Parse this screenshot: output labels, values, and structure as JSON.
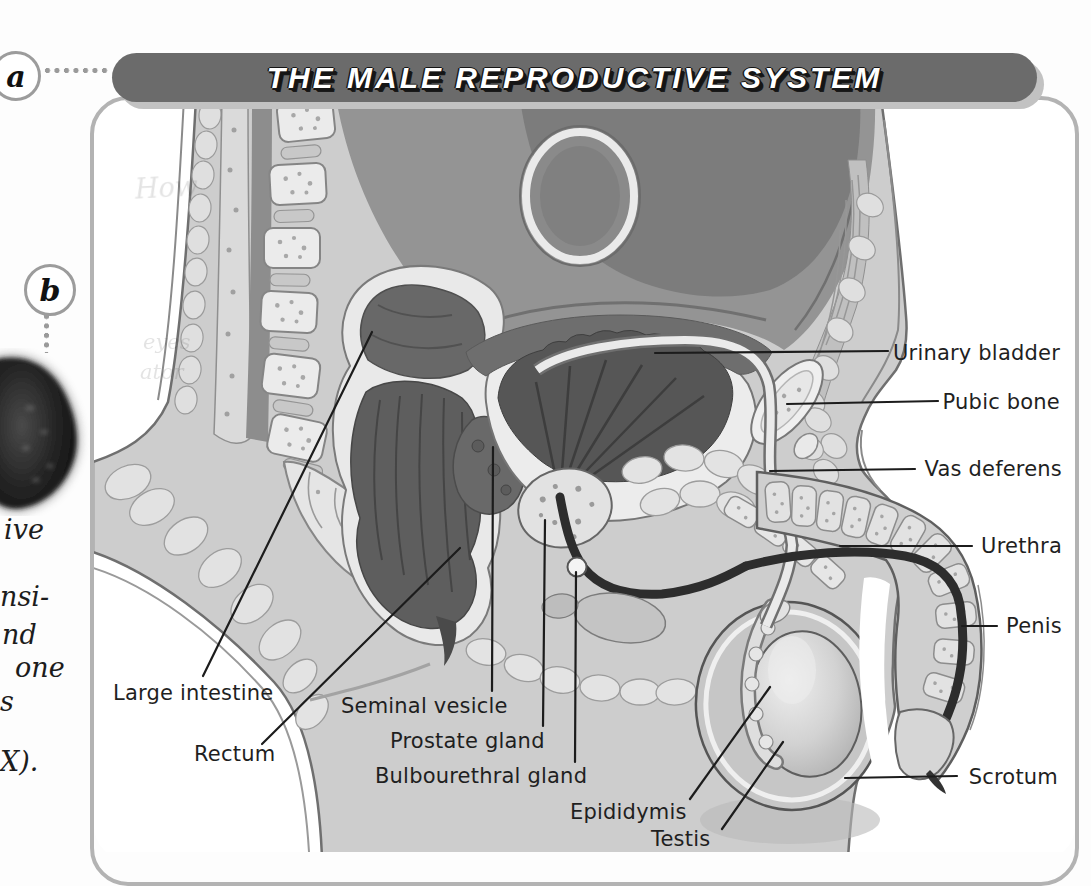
{
  "figure_title": "THE MALE REPRODUCTIVE SYSTEM",
  "markers": {
    "a": "a",
    "b": "b"
  },
  "margin_fragments": [
    "ive",
    "nsi-",
    "nd",
    "one",
    "s",
    "X)."
  ],
  "ghost_fragments": [
    "How",
    "eyes",
    "ator"
  ],
  "labels": {
    "urinary_bladder": "Urinary bladder",
    "pubic_bone": "Pubic bone",
    "vas_deferens": "Vas deferens",
    "urethra": "Urethra",
    "penis": "Penis",
    "scrotum": "Scrotum",
    "large_intestine": "Large intestine",
    "rectum": "Rectum",
    "seminal_vesicle": "Seminal vesicle",
    "prostate_gland": "Prostate gland",
    "bulbourethral_gland": "Bulbourethral gland",
    "epididymis": "Epididymis",
    "testis": "Testis"
  },
  "colors": {
    "banner": "#6b6b6b",
    "banner_shadow": "#c2c2c2",
    "panel_border": "#b3b3b3",
    "label_ink": "#1f1f1f"
  }
}
